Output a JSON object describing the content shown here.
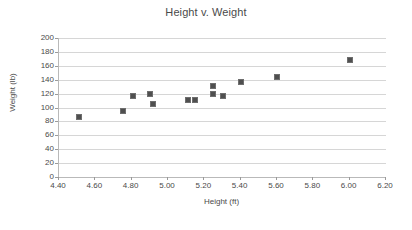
{
  "chart_data": {
    "type": "scatter",
    "title": "Height v. Weight",
    "xlabel": "Height (ft)",
    "ylabel": "Weight (lb)",
    "xlim": [
      4.4,
      6.2
    ],
    "ylim": [
      0,
      200
    ],
    "xticks": [
      "4.40",
      "4.60",
      "4.80",
      "5.00",
      "5.20",
      "5.40",
      "5.60",
      "5.80",
      "6.00",
      "6.20"
    ],
    "xtick_values": [
      4.4,
      4.6,
      4.8,
      5.0,
      5.2,
      5.4,
      5.6,
      5.8,
      6.0,
      6.2
    ],
    "yticks": [
      "0",
      "20",
      "40",
      "60",
      "80",
      "100",
      "120",
      "140",
      "160",
      "180",
      "200"
    ],
    "ytick_values": [
      0,
      20,
      40,
      60,
      80,
      100,
      120,
      140,
      160,
      180,
      200
    ],
    "grid": "horizontal",
    "legend": "none",
    "marker_color": "#4f4f4f",
    "marker_shape": "square",
    "points": [
      {
        "x": 4.51,
        "y": 87
      },
      {
        "x": 4.75,
        "y": 95
      },
      {
        "x": 4.81,
        "y": 116
      },
      {
        "x": 4.9,
        "y": 120
      },
      {
        "x": 4.92,
        "y": 105
      },
      {
        "x": 5.11,
        "y": 111
      },
      {
        "x": 5.15,
        "y": 111
      },
      {
        "x": 5.25,
        "y": 131
      },
      {
        "x": 5.25,
        "y": 120
      },
      {
        "x": 5.3,
        "y": 117
      },
      {
        "x": 5.4,
        "y": 137
      },
      {
        "x": 5.6,
        "y": 144
      },
      {
        "x": 6.0,
        "y": 168
      }
    ]
  }
}
